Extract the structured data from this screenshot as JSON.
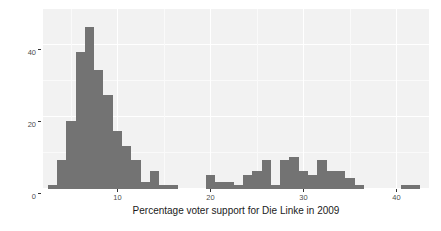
{
  "chart_data": {
    "type": "bar",
    "title": "",
    "subtitle": "",
    "xlabel": "Percentage voter support for Die Linke in 2009",
    "ylabel": "",
    "xlim": [
      2.0,
      43.5
    ],
    "ylim": [
      0,
      50
    ],
    "grid": true,
    "legend": null,
    "bin_width": 1.0,
    "x_ticks": [
      10,
      20,
      30,
      40
    ],
    "x_tick_labels": [
      "10",
      "20",
      "30",
      "40"
    ],
    "y_ticks": [
      0,
      20,
      40
    ],
    "y_tick_labels": [
      "0",
      "20",
      "40"
    ],
    "bar_color": "#737373",
    "panel_color": "#f2f2f2",
    "grid_color": "#ffffff",
    "categories": [
      "3.0",
      "4.0",
      "5.0",
      "6.0",
      "7.0",
      "8.0",
      "9.0",
      "10.0",
      "11.0",
      "12.0",
      "13.0",
      "14.0",
      "15.0",
      "16.0",
      "17.0",
      "18.0",
      "19.0",
      "20.0",
      "21.0",
      "22.0",
      "23.0",
      "24.0",
      "25.0",
      "26.0",
      "27.0",
      "28.0",
      "29.0",
      "30.0",
      "31.0",
      "32.0",
      "33.0",
      "34.0",
      "35.0",
      "36.0",
      "37.0",
      "38.0",
      "39.0",
      "40.0",
      "41.0",
      "42.0"
    ],
    "values": [
      1,
      8,
      19,
      38,
      45,
      33,
      26,
      16,
      12,
      8,
      2,
      5,
      1,
      1,
      0,
      0,
      0,
      4,
      2,
      2,
      1,
      4,
      5,
      8,
      1,
      8,
      9,
      5,
      4,
      8,
      5,
      5,
      3,
      1,
      0,
      0,
      0,
      0,
      1,
      1
    ]
  },
  "axes": {
    "y_label_0": "0",
    "y_label_20": "20",
    "y_label_40": "40",
    "x_label_10": "10",
    "x_label_20": "20",
    "x_label_30": "30",
    "x_label_40": "40"
  },
  "caption": {
    "x_axis_title": "Percentage voter support for Die Linke in 2009"
  }
}
